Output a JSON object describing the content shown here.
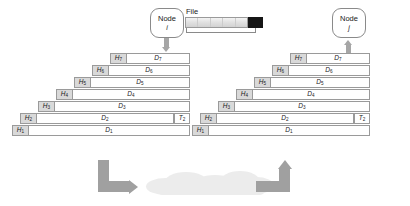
{
  "diagram": {
    "colors": {
      "header_cell": "#d9d9d9",
      "data_cell": "#ffffff",
      "border": "#9a9a9a",
      "arrow": "#a0a0a0",
      "cloud": "#ececec",
      "file_tail": "#151515"
    }
  },
  "source": {
    "node": {
      "label": "Node",
      "sub": "i"
    },
    "file": {
      "caption": "File",
      "segments": 5
    },
    "arrow_direction": "down"
  },
  "destination": {
    "node": {
      "label": "Node",
      "sub": "j"
    },
    "arrow_direction": "up"
  },
  "left_stack": {
    "rows": [
      {
        "h": "H",
        "h_sub": "7",
        "d": "D",
        "d_sub": "7",
        "tail": null,
        "tail_sub": null
      },
      {
        "h": "H",
        "h_sub": "6",
        "d": "D",
        "d_sub": "6",
        "tail": null,
        "tail_sub": null
      },
      {
        "h": "H",
        "h_sub": "5",
        "d": "D",
        "d_sub": "5",
        "tail": null,
        "tail_sub": null
      },
      {
        "h": "H",
        "h_sub": "4",
        "d": "D",
        "d_sub": "4",
        "tail": null,
        "tail_sub": null
      },
      {
        "h": "H",
        "h_sub": "3",
        "d": "D",
        "d_sub": "3",
        "tail": null,
        "tail_sub": null
      },
      {
        "h": "H",
        "h_sub": "2",
        "d": "D",
        "d_sub": "2",
        "tail": "T",
        "tail_sub": "2"
      },
      {
        "h": "H",
        "h_sub": "1",
        "d": "D",
        "d_sub": "1",
        "tail": null,
        "tail_sub": null
      }
    ]
  },
  "right_stack": {
    "rows": [
      {
        "h": "H",
        "h_sub": "7",
        "d": "D",
        "d_sub": "7",
        "tail": null,
        "tail_sub": null
      },
      {
        "h": "H",
        "h_sub": "6",
        "d": "D",
        "d_sub": "6",
        "tail": null,
        "tail_sub": null
      },
      {
        "h": "H",
        "h_sub": "5",
        "d": "D",
        "d_sub": "5",
        "tail": null,
        "tail_sub": null
      },
      {
        "h": "H",
        "h_sub": "4",
        "d": "D",
        "d_sub": "4",
        "tail": null,
        "tail_sub": null
      },
      {
        "h": "H",
        "h_sub": "3",
        "d": "D",
        "d_sub": "3",
        "tail": null,
        "tail_sub": null
      },
      {
        "h": "H",
        "h_sub": "2",
        "d": "D",
        "d_sub": "2",
        "tail": "T",
        "tail_sub": "2"
      },
      {
        "h": "H",
        "h_sub": "1",
        "d": "D",
        "d_sub": "1",
        "tail": null,
        "tail_sub": null
      }
    ]
  },
  "transfer": {
    "outbound_arrow": "down-then-right",
    "inbound_arrow": "left-then-up",
    "medium": "cloud"
  }
}
